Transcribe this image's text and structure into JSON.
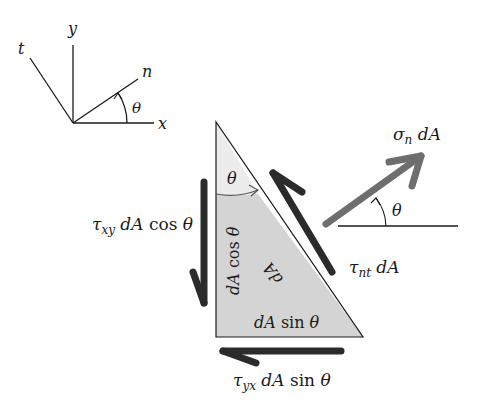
{
  "diagram": {
    "type": "stress-element-free-body",
    "colors": {
      "background": "#ffffff",
      "line": "#1a1a1a",
      "triangle_fill": "#d6d6d6",
      "triangle_top_fill": "#ececec",
      "force_arrow_dark": "#2b2b2b",
      "force_arrow_gray": "#6e6e6e"
    },
    "axes": {
      "y_label": "y",
      "x_label": "x",
      "n_label": "n",
      "t_label": "t",
      "angle_label": "θ"
    },
    "triangle": {
      "corner_angle_label": "θ",
      "left_side_label": "dA cos θ",
      "hypotenuse_label": "dA",
      "bottom_side_label": "dA sin θ"
    },
    "forces": {
      "normal": {
        "symbol": "σ",
        "subscript": "n",
        "suffix": " dA"
      },
      "normal_angle_label": "θ",
      "shear_nt": {
        "symbol": "τ",
        "subscript": "nt",
        "suffix": " dA"
      },
      "shear_xy": {
        "symbol": "τ",
        "subscript": "xy",
        "suffix": " dA cos θ"
      },
      "shear_yx": {
        "symbol": "τ",
        "subscript": "yx",
        "suffix": " dA sin θ"
      }
    }
  }
}
